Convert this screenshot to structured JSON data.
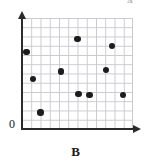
{
  "chart_data": {
    "type": "scatter",
    "title": "",
    "xlabel": "B",
    "ylabel": "A",
    "xlim": [
      0,
      12
    ],
    "ylim": [
      0,
      12
    ],
    "grid": true,
    "legend": false,
    "origin_label": "0",
    "marker_color": "#1c1c1c",
    "grid_color": "#c9c9cf",
    "axis_color": "#2b2b2b",
    "points": [
      {
        "x": 0.5,
        "y": 8.3
      },
      {
        "x": 1.2,
        "y": 5.4
      },
      {
        "x": 2.0,
        "y": 1.8
      },
      {
        "x": 4.2,
        "y": 6.2
      },
      {
        "x": 6.0,
        "y": 9.7
      },
      {
        "x": 6.1,
        "y": 3.8
      },
      {
        "x": 7.3,
        "y": 3.7
      },
      {
        "x": 9.1,
        "y": 6.4
      },
      {
        "x": 9.7,
        "y": 9.0
      },
      {
        "x": 10.9,
        "y": 3.7
      }
    ]
  },
  "axes": {
    "origin": "0",
    "x_label": "B",
    "y_label": "A"
  }
}
